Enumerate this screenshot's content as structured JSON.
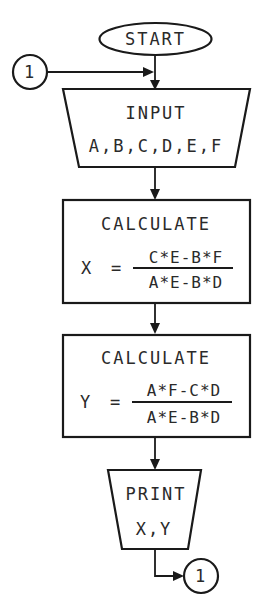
{
  "colors": {
    "stroke": "#1a1a1a",
    "text": "#2a2a2a",
    "background": "#ffffff"
  },
  "start": {
    "label": "START"
  },
  "connector_in": {
    "label": "1"
  },
  "connector_out": {
    "label": "1"
  },
  "input": {
    "title": "INPUT",
    "vars": "A,B,C,D,E,F"
  },
  "calc_x": {
    "title": "CALCULATE",
    "lhs": "X",
    "eq": "=",
    "numerator": "C*E-B*F",
    "denominator": "A*E-B*D"
  },
  "calc_y": {
    "title": "CALCULATE",
    "lhs": "Y",
    "eq": "=",
    "numerator": "A*F-C*D",
    "denominator": "A*E-B*D"
  },
  "print": {
    "title": "PRINT",
    "vars": "X,Y"
  }
}
